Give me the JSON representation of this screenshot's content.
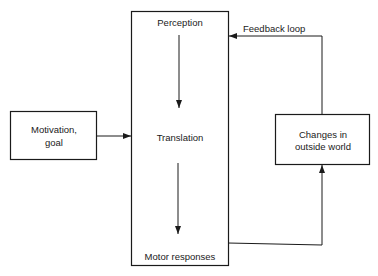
{
  "diagram": {
    "central_box": {
      "top_label": "Perception",
      "middle_label": "Translation",
      "bottom_label": "Motor responses"
    },
    "input_box": {
      "line1": "Motivation,",
      "line2": "goal"
    },
    "output_box": {
      "line1": "Changes in",
      "line2": "outside world"
    },
    "feedback_label": "Feedback loop",
    "edges": [
      {
        "from": "input_box",
        "to": "central_box"
      },
      {
        "from": "Perception",
        "to": "Translation"
      },
      {
        "from": "Translation",
        "to": "Motor responses"
      },
      {
        "from": "Motor responses",
        "to": "output_box"
      },
      {
        "from": "output_box",
        "to": "central_box",
        "label": "Feedback loop"
      }
    ]
  }
}
